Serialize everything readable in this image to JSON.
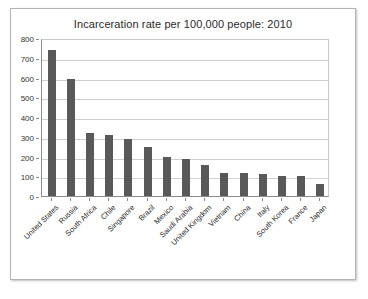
{
  "chart_data": {
    "type": "bar",
    "title": "Incarceration rate per 100,000 people: 2010",
    "xlabel": "",
    "ylabel": "",
    "ylim": [
      0,
      800
    ],
    "ytick_step": 100,
    "yticks": [
      0,
      100,
      200,
      300,
      400,
      500,
      600,
      700,
      800
    ],
    "grid": true,
    "legend": false,
    "bar_color": "#595959",
    "categories": [
      "United States",
      "Russia",
      "South Africa",
      "Chile",
      "Singapore",
      "Brazil",
      "Mexico",
      "Saudi Arabia",
      "United Kingdom",
      "Vietnam",
      "China",
      "Italy",
      "South Korea",
      "France",
      "Japan"
    ],
    "values": [
      740,
      590,
      320,
      310,
      288,
      250,
      200,
      185,
      155,
      118,
      115,
      110,
      100,
      100,
      60
    ]
  }
}
